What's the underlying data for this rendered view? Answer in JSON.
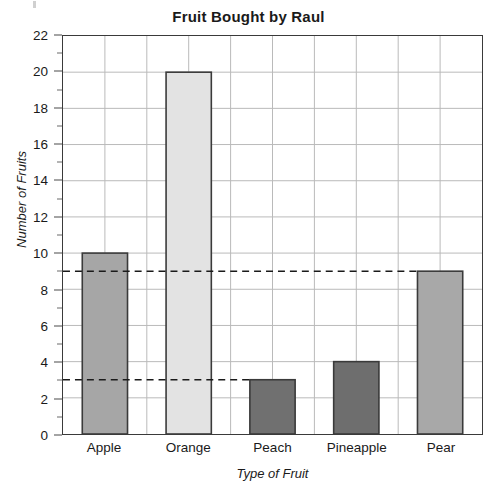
{
  "chart_data": {
    "type": "bar",
    "title": "Fruit Bought by Raul",
    "xlabel": "Type of Fruit",
    "ylabel": "Number of Fruits",
    "categories": [
      "Apple",
      "Orange",
      "Peach",
      "Pineapple",
      "Pear"
    ],
    "values": [
      10,
      20,
      3,
      4,
      9
    ],
    "ylim": [
      0,
      22
    ],
    "y_major_step": 2,
    "y_minor_step": 1,
    "y_tick_labels": [
      "0",
      "2",
      "4",
      "6",
      "8",
      "10",
      "12",
      "14",
      "16",
      "18",
      "20",
      "22"
    ],
    "grid": true,
    "legend": "none",
    "bar_colors": [
      "#a6a6a6",
      "#e3e3e3",
      "#707070",
      "#6e6e6e",
      "#a8a8a8"
    ],
    "bar_edge_color": "#3a3a3a",
    "grid_color": "#b9b9b9",
    "axis_color": "#3a3a3a",
    "annotations": [
      {
        "type": "dashed-reference-line",
        "value": 9,
        "from": "y-axis",
        "to": "Pear"
      },
      {
        "type": "dashed-reference-line",
        "value": 3,
        "from": "y-axis",
        "to": "Peach"
      }
    ]
  }
}
